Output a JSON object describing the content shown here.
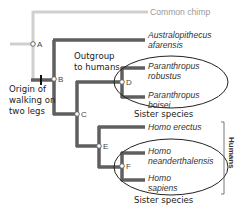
{
  "diagram": {
    "type": "phylogenetic-tree",
    "taxa": [
      {
        "id": "chimp",
        "label": "Common chimp",
        "italic": false,
        "color": "#b0b0b0"
      },
      {
        "id": "afarensis",
        "line1": "Australopithecus",
        "line2": "afarensis"
      },
      {
        "id": "robustus",
        "line1": "Paranthropus",
        "line2": "robustus"
      },
      {
        "id": "boisei",
        "line1": "Paranthropus",
        "line2": "boisei"
      },
      {
        "id": "erectus",
        "label": "Homo erectus"
      },
      {
        "id": "neanderthalensis",
        "line1": "Homo",
        "line2": "neanderthalensis"
      },
      {
        "id": "sapiens",
        "line1": "Homo",
        "line2": "sapiens"
      }
    ],
    "nodes": [
      "A",
      "B",
      "C",
      "D",
      "E",
      "F"
    ],
    "annotations": {
      "outgroup_line1": "Outgroup",
      "outgroup_line2": "to humans",
      "origin_line1": "Origin of",
      "origin_line2": "walking on",
      "origin_line3": "two legs",
      "sister_species_top": "Sister species",
      "sister_species_bottom": "Sister species",
      "humans_bracket": "Humans"
    },
    "colors": {
      "branch_dark": "#5f5f5f",
      "branch_gray": "#cfcfcf",
      "node_fill": "#ffffff",
      "ellipse_stroke": "#222222"
    }
  }
}
